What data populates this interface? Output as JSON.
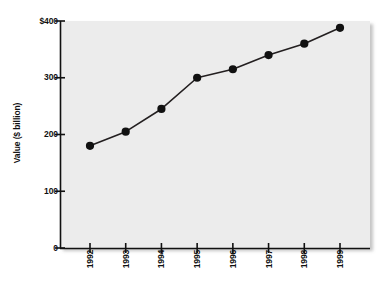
{
  "chart_data": {
    "type": "line",
    "title": "",
    "xlabel": "",
    "ylabel": "Value ($ billion)",
    "categories": [
      "1992",
      "1993",
      "1994",
      "1995",
      "1996",
      "1997",
      "1998",
      "1999"
    ],
    "values": [
      180,
      205,
      245,
      300,
      315,
      340,
      360,
      388
    ],
    "series": [
      {
        "name": "Value",
        "values": [
          180,
          205,
          245,
          300,
          315,
          340,
          360,
          388
        ]
      }
    ],
    "ylim": [
      0,
      400
    ],
    "yticks": [
      0,
      100,
      200,
      300,
      400
    ],
    "ytick_labels": [
      "0",
      "100",
      "200",
      "300",
      "$400"
    ],
    "grid": false,
    "legend": false,
    "legend_position": "none",
    "marker": "filled-circle",
    "line_color": "#231f20",
    "marker_color": "#111111",
    "plot_background": "#ececec",
    "page_background": "#ffffff"
  },
  "axes": {
    "y_title": "Value ($ billion)",
    "y_tick_labels": [
      "$400",
      "300",
      "200",
      "100",
      "0"
    ],
    "x_tick_labels": [
      "1992",
      "1993",
      "1994",
      "1995",
      "1996",
      "1997",
      "1998",
      "1999"
    ]
  }
}
